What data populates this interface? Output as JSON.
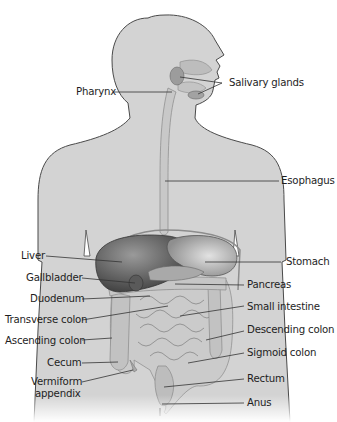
{
  "figure": {
    "colors": {
      "body_fill": "#d3d3d3",
      "body_outline": "#4a4a4a",
      "liver": "#5e5e5e",
      "stomach": "#b9b9b9",
      "intestine": "#c9c9c9",
      "leader_line": "#333333",
      "label_text": "#1e1e1e"
    }
  },
  "labels": {
    "left": [
      {
        "id": "pharynx",
        "text": "Pharynx"
      },
      {
        "id": "liver",
        "text": "Liver"
      },
      {
        "id": "gallbladder",
        "text": "Gallbladder"
      },
      {
        "id": "duodenum",
        "text": "Duodenum"
      },
      {
        "id": "transverse_colon",
        "text": "Transverse colon"
      },
      {
        "id": "ascending_colon",
        "text": "Ascending colon"
      },
      {
        "id": "cecum",
        "text": "Cecum"
      },
      {
        "id": "vermiform_appendix_1",
        "text": "Vermiform"
      },
      {
        "id": "vermiform_appendix_2",
        "text": "appendix"
      }
    ],
    "right": [
      {
        "id": "salivary_glands",
        "text": "Salivary glands"
      },
      {
        "id": "esophagus",
        "text": "Esophagus"
      },
      {
        "id": "stomach",
        "text": "Stomach"
      },
      {
        "id": "pancreas",
        "text": "Pancreas"
      },
      {
        "id": "small_intestine",
        "text": "Small intestine"
      },
      {
        "id": "descending_colon",
        "text": "Descending colon"
      },
      {
        "id": "sigmoid_colon",
        "text": "Sigmoid colon"
      },
      {
        "id": "rectum",
        "text": "Rectum"
      },
      {
        "id": "anus",
        "text": "Anus"
      }
    ]
  }
}
